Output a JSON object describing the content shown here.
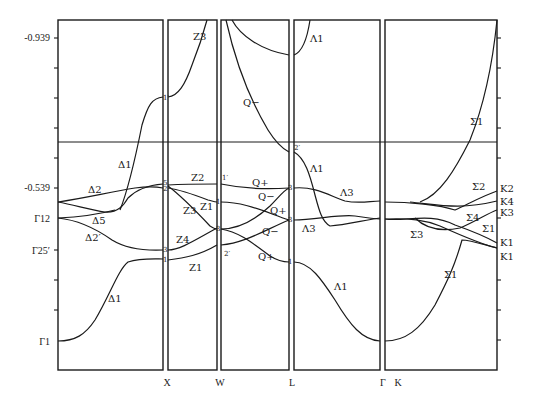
{
  "figure": {
    "type": "band-structure",
    "y_axis": {
      "tick_labels": [
        {
          "text": "-0.939",
          "y": 38
        },
        {
          "text": "-0.539",
          "y": 188
        },
        {
          "text": "Γ12",
          "y": 218
        },
        {
          "text": "Γ25′",
          "y": 250
        },
        {
          "text": "Γ1",
          "y": 341
        }
      ]
    },
    "x_axis": {
      "points": [
        {
          "text": "X",
          "x": 167
        },
        {
          "text": "W",
          "x": 220
        },
        {
          "text": "L",
          "x": 292
        },
        {
          "text": "Γ",
          "x": 383
        },
        {
          "text": "K",
          "x": 398
        }
      ]
    },
    "panels": [
      {
        "name": "Gamma-X",
        "branch": "Δ",
        "x0": 58,
        "x1": 163
      },
      {
        "name": "X-W",
        "branch": "Z",
        "x0": 168,
        "x1": 217
      },
      {
        "name": "W-L",
        "branch": "Q",
        "x0": 221,
        "x1": 289
      },
      {
        "name": "L-Gamma",
        "branch": "Λ",
        "x0": 294,
        "x1": 380
      },
      {
        "name": "K-Gamma",
        "branch": "Σ",
        "x0": 385,
        "x1": 497
      }
    ],
    "band_labels": {
      "delta1_upper": "Δ1",
      "delta2": "Δ2",
      "delta5": "Δ5",
      "delta2p": "Δ2′",
      "delta1_lower": "Δ1",
      "z3_top": "Z3",
      "z2": "Z2",
      "z3": "Z3",
      "z1_mid": "Z1",
      "z4": "Z4",
      "z1_low": "Z1",
      "q_minus_top": "Q−",
      "q_plus_1": "Q+",
      "q_minus_1": "Q−",
      "q_plus_2": "Q+",
      "q_minus_2": "Q−",
      "q_plus_3": "Q+",
      "lambda1_top": "Λ1",
      "lambda1_mid": "Λ1",
      "lambda3_a": "Λ3",
      "lambda3_b": "Λ3",
      "lambda1_low": "Λ1",
      "sigma1_top": "Σ1",
      "sigma2": "Σ2",
      "sigma4": "Σ4",
      "sigma1_mid": "Σ1",
      "sigma3": "Σ3",
      "sigma1_low": "Σ1"
    },
    "symmetry_labels": {
      "x1p": "1′",
      "x5": "5",
      "x2": "2",
      "x3": "3",
      "x1": "1",
      "w1p": "1′",
      "w1": "1",
      "w3": "3",
      "w2p": "2′",
      "l2p": "2′",
      "l3a": "3",
      "l3b": "3",
      "l1": "1",
      "k2": "K2",
      "k4": "K4",
      "k3": "K3",
      "k1a": "K1",
      "k1b": "K1"
    }
  }
}
